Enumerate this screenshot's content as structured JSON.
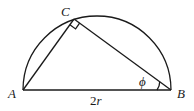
{
  "diagram": {
    "points": {
      "A": {
        "label": "A",
        "x": 23,
        "y": 90
      },
      "B": {
        "label": "B",
        "x": 171,
        "y": 90
      },
      "C": {
        "label": "C",
        "x": 74,
        "y": 19
      }
    },
    "base_label_num": "2",
    "base_label_var": "r",
    "angle_label": "ϕ",
    "right_angle_at": "C",
    "angle_at": "B",
    "colors": {
      "stroke": "#1a1a1a",
      "background": "#ffffff"
    }
  }
}
